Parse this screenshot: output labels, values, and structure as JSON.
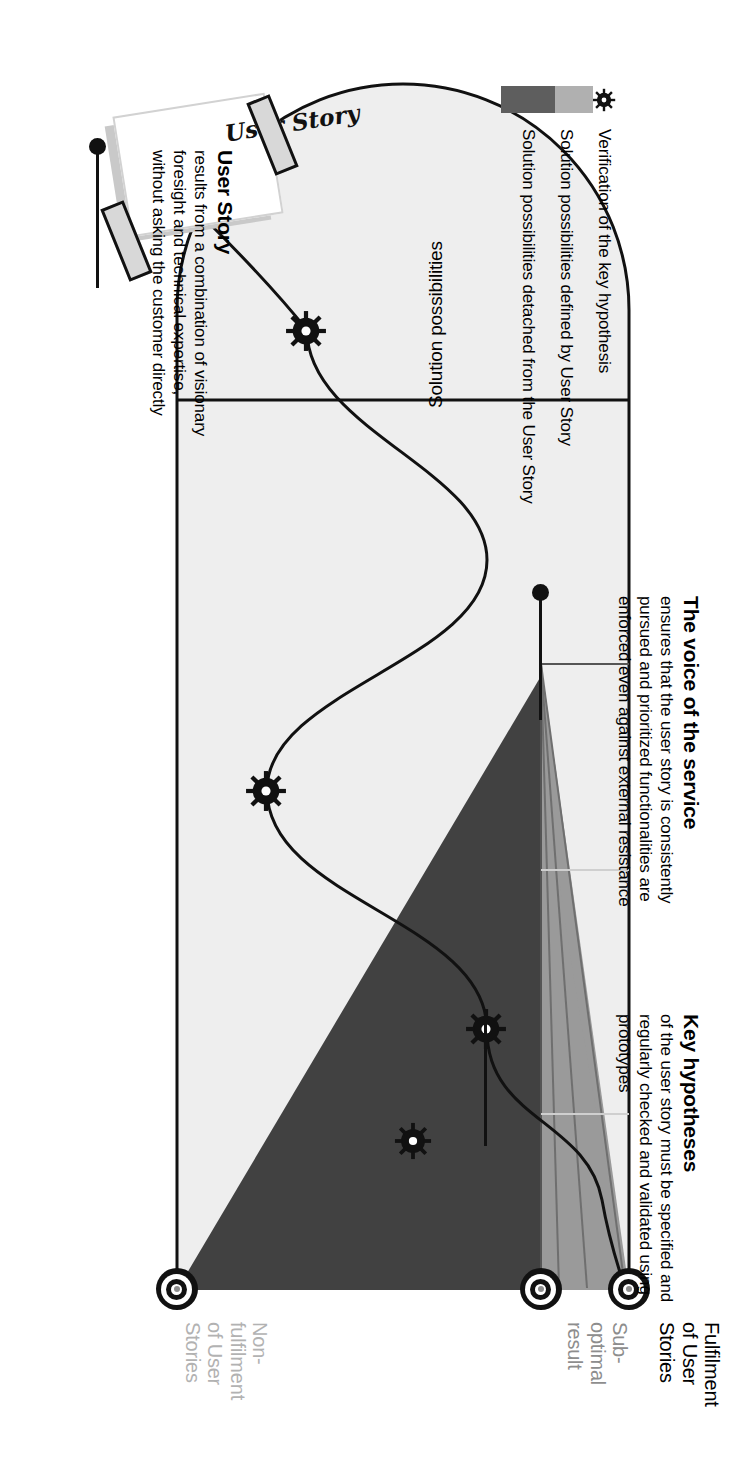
{
  "diagram": {
    "title_hidden": "User Story value-funnel diagram",
    "orientation": "rotated-90",
    "solution_area_label": "Solution possibilities",
    "card": {
      "label": "User Story"
    },
    "callouts": [
      {
        "id": "user-story",
        "title": "User Story",
        "body": "results from a combination of visionary foresight and technical expertise, without asking the customer directly"
      },
      {
        "id": "voice-of-the-service",
        "title": "The voice of the service",
        "body": "ensures that the user story is consistently pursued and prioritized functionalities are enforced even against external resistance"
      },
      {
        "id": "key-hypotheses",
        "title": "Key hypotheses",
        "body": "of the user story must be specified and regularly checked and validated using prototypes"
      }
    ],
    "outcomes": [
      {
        "id": "fulfilment",
        "lines": [
          "Fulfilment",
          "of User",
          "Stories"
        ],
        "tone": "dark"
      },
      {
        "id": "sub-optimal",
        "lines": [
          "Sub-",
          "optimal",
          "result"
        ],
        "tone": "mid"
      },
      {
        "id": "non-fulfilment",
        "lines": [
          "Non-",
          "fulfilment",
          "of User",
          "Stories"
        ],
        "tone": "light"
      }
    ],
    "legend": [
      {
        "id": "verification",
        "kind": "gear",
        "label": "Verification of the key hypothesis"
      },
      {
        "id": "defined",
        "kind": "swatch",
        "label": "Solution possibilities defined by User Story",
        "color": "#b0b0b0"
      },
      {
        "id": "detached",
        "kind": "swatch",
        "label": "Solution possibilities detached from the User Story",
        "color": "#5e5e5e"
      }
    ],
    "colors": {
      "funnel_light": "#eeeeee",
      "funnel_mid": "#9a9a9a",
      "funnel_dark": "#414141",
      "line": "#111111",
      "outcome_mid_text": "#8d8d8d",
      "outcome_light_text": "#b2b2b2"
    },
    "gear_markers_count": 4
  }
}
